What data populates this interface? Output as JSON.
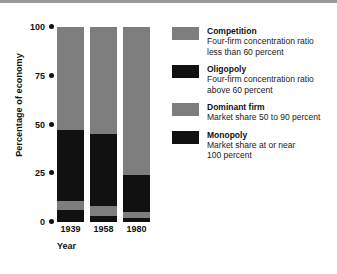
{
  "chart_data": {
    "type": "bar",
    "subtype": "stacked-column",
    "title": "",
    "xlabel": "Year",
    "ylabel": "Percentage of economy",
    "categories": [
      "1939",
      "1958",
      "1980"
    ],
    "ylim": [
      0,
      100
    ],
    "yticks": [
      0,
      25,
      50,
      75,
      100
    ],
    "ytick_labels": [
      "0",
      "25",
      "50",
      "75",
      "100"
    ],
    "grid": false,
    "legend_position": "right",
    "stack_order_bottom_to_top": [
      "Monopoly",
      "Dominant firm",
      "Oligopoly",
      "Competition"
    ],
    "series": [
      {
        "name": "Monopoly",
        "color": "#111111",
        "values": [
          6,
          3,
          2
        ]
      },
      {
        "name": "Dominant firm",
        "color": "#7d7d7d",
        "values": [
          5,
          5,
          3
        ]
      },
      {
        "name": "Oligopoly",
        "color": "#111111",
        "values": [
          36,
          37,
          19
        ]
      },
      {
        "name": "Competition",
        "color": "#7d7d7d",
        "values": [
          53,
          55,
          76
        ]
      }
    ]
  },
  "legend": {
    "items": [
      {
        "swatch_color": "#7d7d7d",
        "title": "Competition",
        "desc": "Four-firm concentration ratio\nless than 60 percent"
      },
      {
        "swatch_color": "#111111",
        "title": "Oligopoly",
        "desc": "Four-firm concentration ratio\nabove 60 percent"
      },
      {
        "swatch_color": "#7d7d7d",
        "title": "Dominant firm",
        "desc": "Market share 50 to 90 percent"
      },
      {
        "swatch_color": "#111111",
        "title": "Monopoly",
        "desc": "Market share at or near\n100 percent"
      }
    ]
  },
  "colors": {
    "gray": "#7d7d7d",
    "black": "#111111",
    "rule": "#9a9a9a",
    "background": "#ffffff"
  }
}
